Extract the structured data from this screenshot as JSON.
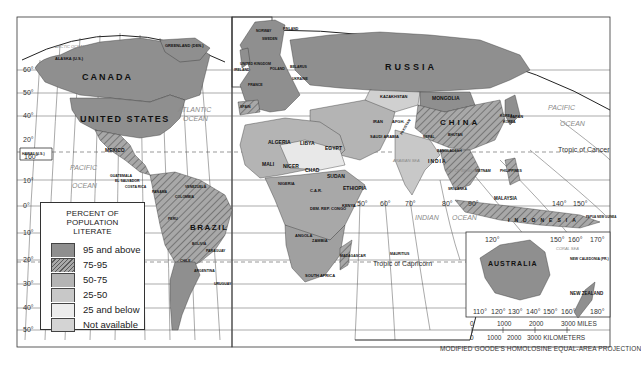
{
  "map": {
    "title": "PERCENT OF POPULATION LITERATE",
    "projection": "MODIFIED GOODE'S HOMOLOSINE EQUAL-AREA PROJECTION",
    "legend": {
      "title_line1": "PERCENT OF POPULATION",
      "title_line2": "LITERATE",
      "items": [
        {
          "label": "95 and above",
          "color": "#8f8f8f",
          "pattern": "solid"
        },
        {
          "label": "75-95",
          "color": "#a8a8a8",
          "pattern": "hatched"
        },
        {
          "label": "50-75",
          "color": "#b4b4b4",
          "pattern": "solid"
        },
        {
          "label": "25-50",
          "color": "#c8c8c8",
          "pattern": "solid"
        },
        {
          "label": "25 and below",
          "color": "#e8e8e8",
          "pattern": "solid"
        },
        {
          "label": "Not available",
          "color": "#d4d4d4",
          "pattern": "solid"
        }
      ]
    },
    "scale": {
      "miles_ticks": [
        "0",
        "1000",
        "2000",
        "3000 MILES"
      ],
      "km_ticks": [
        "0",
        "1000",
        "2000",
        "3000 KILOMETERS"
      ]
    },
    "oceans": {
      "arctic": "ARCTIC OCEAN",
      "atlantic_1": "ATLANTIC",
      "atlantic_2": "OCEAN",
      "pacific_w1": "PACIFIC",
      "pacific_w2": "OCEAN",
      "pacific_e1": "PACIFIC",
      "pacific_e2": "OCEAN",
      "indian_1": "INDIAN",
      "indian_2": "OCEAN",
      "arabian": "ARABIAN SEA",
      "bengal": "BAY OF BENGAL",
      "coral": "CORAL SEA"
    },
    "lines": {
      "cancer": "Tropic of Cancer",
      "capricorn": "Tropic of Capricorn"
    },
    "countries": {
      "canada": "CANADA",
      "usa": "UNITED STATES",
      "alaska": "ALASKA (U.S.)",
      "greenland": "GREENLAND (DEN.)",
      "mexico": "MEXICO",
      "hawaii": "HAWAII (U.S.)",
      "brazil": "BRAZIL",
      "argentina": "ARGENTINA",
      "bolivia": "BOLIVIA",
      "chile": "CHILE",
      "paraguay": "PARAGUAY",
      "uruguay": "URUGUAY",
      "peru": "PERU",
      "colombia": "COLOMBIA",
      "venezuela": "VENEZUELA",
      "guatemala": "GUATEMALA",
      "el_salvador": "EL SALVADOR",
      "costa_rica": "COSTA RICA",
      "panama": "PANAMA",
      "russia": "RUSSIA",
      "kazakhstan": "KAZAKHSTAN",
      "mongolia": "MONGOLIA",
      "china": "CHINA",
      "japan": "JAPAN",
      "india": "INDIA",
      "iran": "IRAN",
      "afghan": "AFGH.",
      "pakistan": "PAKISTAN",
      "algeria": "ALGERIA",
      "libya": "LIBYA",
      "egypt": "EGYPT",
      "mali": "MALI",
      "niger": "NIGER",
      "chad": "CHAD",
      "sudan": "SUDAN",
      "ethiopia": "ETHIOPIA",
      "nigeria": "NIGERIA",
      "car": "C.A.R.",
      "kenya": "KENYA",
      "dem_rep_congo": "DEM. REP. CONGO",
      "angola": "ANGOLA",
      "zambia": "ZAMBIA",
      "south_africa": "SOUTH AFRICA",
      "madagascar": "MADAGASCAR",
      "mauritius": "MAURITIUS",
      "saudi_arabia": "SAUDI ARABIA",
      "finland": "FINLAND",
      "sweden": "SWEDEN",
      "norway": "NORWAY",
      "poland": "POLAND",
      "ukraine": "UKRAINE",
      "belarus": "BELARUS",
      "france": "FRANCE",
      "spain": "SPAIN",
      "uk": "UNITED KINGDOM",
      "ireland": "IRELAND",
      "malaysia": "MALAYSIA",
      "indonesia": "INDONESIA",
      "philippines": "PHILIPPINES",
      "vietnam": "VIETNAM",
      "australia": "AUSTRALIA",
      "new_zealand": "NEW ZEALAND",
      "new_caledonia": "NEW CALEDONIA (FR.)",
      "png": "PAPUA NEW GUINEA",
      "sri_lanka": "SRI LANKA",
      "bangladesh": "BANGLADESH",
      "nepal": "NEPAL",
      "bhutan": "BHUTAN",
      "korea_n": "KOREA",
      "korea_s": "KOREA"
    },
    "lat_labels_left": [
      "60°",
      "50°",
      "40°",
      "20°",
      "10°",
      "0°",
      "10°",
      "20°",
      "30°",
      "40°",
      "50°"
    ],
    "hawaii_lon": "160°",
    "mid_lon_labels": [
      "50°",
      "60°",
      "70°",
      "80°",
      "90°"
    ],
    "pac_lon_labels": [
      "140°",
      "150°"
    ],
    "aus_lon_labels": [
      "110°",
      "120°",
      "130°",
      "140°",
      "150°",
      "160°",
      "180°"
    ],
    "aus_top_lon": [
      "120°",
      "150°",
      "160°",
      "170°"
    ]
  }
}
